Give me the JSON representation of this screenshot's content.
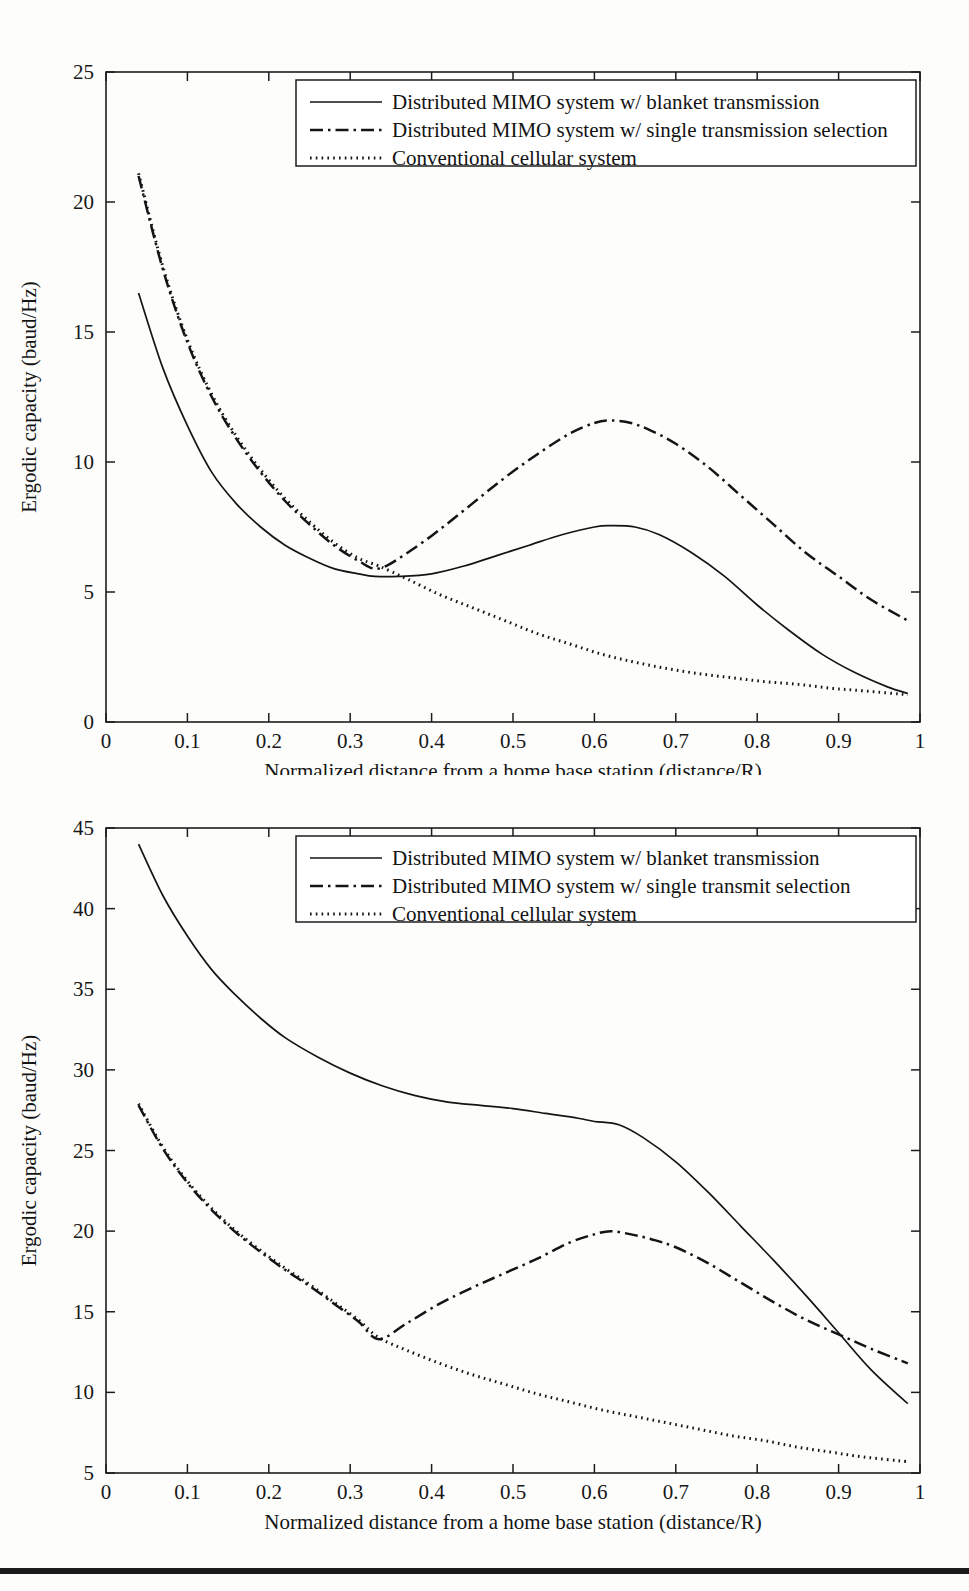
{
  "page": {
    "background_color": "#fdfdfc",
    "ink_color": "#141414",
    "bottom_rule_color": "#1c1c1c"
  },
  "chart_data": [
    {
      "id": "top",
      "type": "line",
      "title": "",
      "xlabel": "Normalized distance from a home base station (distance/R)",
      "ylabel": "Ergodic capacity (baud/Hz)",
      "xlim": [
        0,
        1
      ],
      "ylim": [
        0,
        25
      ],
      "xticks": [
        0,
        0.1,
        0.2,
        0.3,
        0.4,
        0.5,
        0.6,
        0.7,
        0.8,
        0.9,
        1
      ],
      "yticks": [
        0,
        5,
        10,
        15,
        20,
        25
      ],
      "xticklabels": [
        "0",
        "0.1",
        "0.2",
        "0.3",
        "0.4",
        "0.5",
        "0.6",
        "0.7",
        "0.8",
        "0.9",
        "1"
      ],
      "yticklabels": [
        "0",
        "5",
        "10",
        "15",
        "20",
        "25"
      ],
      "grid": false,
      "legend_position": "upper right",
      "series": [
        {
          "name": "Distributed MIMO system w/ blanket transmission",
          "style": "solid",
          "x": [
            0.04,
            0.07,
            0.1,
            0.13,
            0.16,
            0.19,
            0.22,
            0.25,
            0.28,
            0.31,
            0.33,
            0.36,
            0.4,
            0.44,
            0.48,
            0.52,
            0.56,
            0.6,
            0.62,
            0.65,
            0.68,
            0.72,
            0.76,
            0.8,
            0.84,
            0.88,
            0.92,
            0.96,
            0.985
          ],
          "y": [
            16.5,
            13.6,
            11.4,
            9.6,
            8.4,
            7.5,
            6.8,
            6.3,
            5.9,
            5.7,
            5.6,
            5.6,
            5.7,
            6.0,
            6.4,
            6.8,
            7.2,
            7.5,
            7.55,
            7.5,
            7.2,
            6.5,
            5.6,
            4.5,
            3.5,
            2.6,
            1.9,
            1.35,
            1.1
          ]
        },
        {
          "name": "Distributed MIMO system w/ single transmission selection",
          "style": "dashdot",
          "x": [
            0.04,
            0.07,
            0.1,
            0.13,
            0.16,
            0.19,
            0.22,
            0.25,
            0.28,
            0.31,
            0.335,
            0.37,
            0.41,
            0.45,
            0.49,
            0.53,
            0.57,
            0.6,
            0.62,
            0.645,
            0.67,
            0.7,
            0.74,
            0.78,
            0.82,
            0.86,
            0.9,
            0.94,
            0.985
          ],
          "y": [
            21.0,
            17.4,
            14.6,
            12.5,
            10.9,
            9.6,
            8.5,
            7.6,
            6.8,
            6.2,
            5.9,
            6.5,
            7.4,
            8.4,
            9.4,
            10.3,
            11.1,
            11.5,
            11.6,
            11.5,
            11.2,
            10.7,
            9.8,
            8.7,
            7.6,
            6.5,
            5.6,
            4.7,
            3.9
          ]
        },
        {
          "name": "Conventional cellular system",
          "style": "dotted",
          "x": [
            0.04,
            0.07,
            0.1,
            0.13,
            0.16,
            0.19,
            0.22,
            0.25,
            0.28,
            0.31,
            0.335,
            0.37,
            0.41,
            0.45,
            0.49,
            0.53,
            0.57,
            0.61,
            0.65,
            0.69,
            0.73,
            0.77,
            0.81,
            0.85,
            0.89,
            0.93,
            0.985
          ],
          "y": [
            21.1,
            17.5,
            14.7,
            12.6,
            11.0,
            9.7,
            8.6,
            7.7,
            6.9,
            6.3,
            6.0,
            5.5,
            4.9,
            4.4,
            3.9,
            3.4,
            3.0,
            2.6,
            2.3,
            2.05,
            1.85,
            1.7,
            1.55,
            1.45,
            1.3,
            1.2,
            1.05
          ]
        }
      ]
    },
    {
      "id": "bottom",
      "type": "line",
      "title": "",
      "xlabel": "Normalized distance from a home base station (distance/R)",
      "ylabel": "Ergodic capacity (baud/Hz)",
      "xlim": [
        0,
        1
      ],
      "ylim": [
        5,
        45
      ],
      "xticks": [
        0,
        0.1,
        0.2,
        0.3,
        0.4,
        0.5,
        0.6,
        0.7,
        0.8,
        0.9,
        1
      ],
      "yticks": [
        5,
        10,
        15,
        20,
        25,
        30,
        35,
        40,
        45
      ],
      "xticklabels": [
        "0",
        "0.1",
        "0.2",
        "0.3",
        "0.4",
        "0.5",
        "0.6",
        "0.7",
        "0.8",
        "0.9",
        "1"
      ],
      "yticklabels": [
        "5",
        "10",
        "15",
        "20",
        "25",
        "30",
        "35",
        "40",
        "45"
      ],
      "grid": false,
      "legend_position": "upper right",
      "series": [
        {
          "name": "Distributed MIMO system w/ blanket transmission",
          "style": "solid",
          "x": [
            0.04,
            0.07,
            0.1,
            0.13,
            0.16,
            0.19,
            0.22,
            0.26,
            0.3,
            0.34,
            0.38,
            0.42,
            0.46,
            0.5,
            0.54,
            0.58,
            0.6,
            0.63,
            0.66,
            0.7,
            0.74,
            0.78,
            0.82,
            0.86,
            0.9,
            0.94,
            0.985
          ],
          "y": [
            44.0,
            40.8,
            38.3,
            36.2,
            34.6,
            33.2,
            32.0,
            30.8,
            29.8,
            29.0,
            28.4,
            28.0,
            27.8,
            27.6,
            27.3,
            27.0,
            26.8,
            26.6,
            25.8,
            24.3,
            22.4,
            20.3,
            18.2,
            16.0,
            13.7,
            11.4,
            9.3
          ]
        },
        {
          "name": "Distributed MIMO system w/ single transmit selection",
          "style": "dashdot",
          "x": [
            0.04,
            0.07,
            0.1,
            0.13,
            0.16,
            0.19,
            0.22,
            0.25,
            0.28,
            0.31,
            0.335,
            0.37,
            0.41,
            0.45,
            0.49,
            0.53,
            0.57,
            0.6,
            0.62,
            0.645,
            0.67,
            0.7,
            0.74,
            0.78,
            0.82,
            0.86,
            0.9,
            0.94,
            0.985
          ],
          "y": [
            27.8,
            25.1,
            23.0,
            21.3,
            19.9,
            18.7,
            17.6,
            16.6,
            15.5,
            14.4,
            13.3,
            14.3,
            15.5,
            16.5,
            17.4,
            18.3,
            19.3,
            19.8,
            20.0,
            19.8,
            19.5,
            19.0,
            18.0,
            16.8,
            15.6,
            14.5,
            13.6,
            12.7,
            11.8
          ]
        },
        {
          "name": "Conventional cellular system",
          "style": "dotted",
          "x": [
            0.04,
            0.07,
            0.1,
            0.13,
            0.16,
            0.19,
            0.22,
            0.25,
            0.28,
            0.31,
            0.335,
            0.37,
            0.41,
            0.45,
            0.49,
            0.53,
            0.57,
            0.61,
            0.65,
            0.69,
            0.73,
            0.77,
            0.81,
            0.85,
            0.89,
            0.93,
            0.985
          ],
          "y": [
            27.9,
            25.2,
            23.1,
            21.4,
            20.0,
            18.8,
            17.7,
            16.7,
            15.6,
            14.5,
            13.4,
            12.6,
            11.8,
            11.1,
            10.5,
            9.9,
            9.4,
            8.9,
            8.5,
            8.1,
            7.7,
            7.3,
            7.0,
            6.6,
            6.3,
            6.0,
            5.7
          ]
        }
      ]
    }
  ]
}
